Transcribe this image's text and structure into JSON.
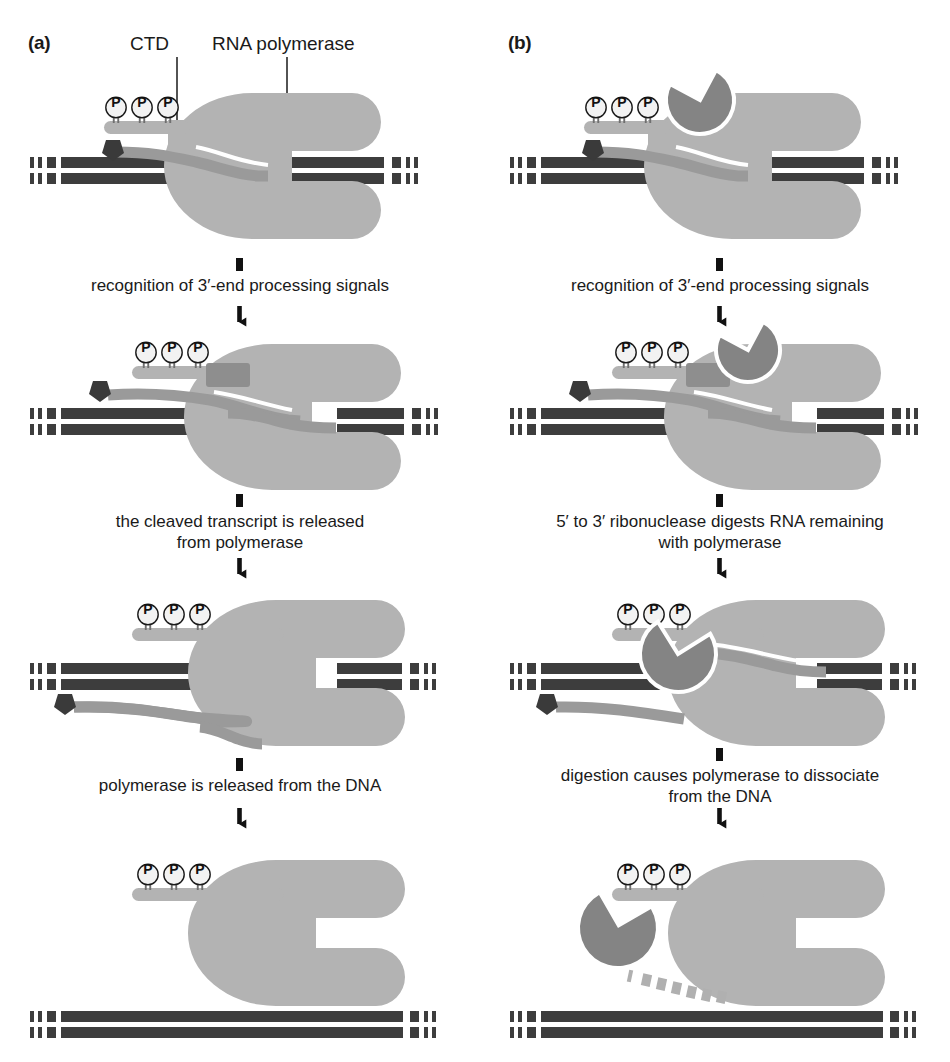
{
  "figure": {
    "title_a": "(a)",
    "title_b": "(b)",
    "callouts": {
      "ctd": "CTD",
      "rna_polymerase": "RNA polymerase"
    },
    "colors": {
      "polymerase": "#b3b3b3",
      "ribonuclease": "#848484",
      "rna": "#9a9a9a",
      "dna": "#3d3d3d",
      "cap": "#3a3a3a",
      "cleavage_factor": "#8e8e8e",
      "phosphate_fill": "#f2f2f2",
      "outline": "#1a1a1a",
      "background": "#ffffff"
    },
    "phosphate_label": "P",
    "phosphate_count": 3
  },
  "columns": [
    {
      "id": "a",
      "label": "(a)",
      "steps": [
        "recognition of 3′-end processing signals",
        "the cleaved transcript is released\nfrom polymerase",
        "polymerase is released from the DNA"
      ],
      "stages": [
        "elongating polymerase with phosphorylated CTD and nascent capped RNA",
        "cleavage factor bound at CTD, transcript cleaved",
        "cleaved transcript released, polymerase still on DNA",
        "polymerase released from the DNA"
      ]
    },
    {
      "id": "b",
      "label": "(b)",
      "steps": [
        "recognition of 3′-end processing signals",
        "5′ to 3′ ribonuclease digests RNA remaining\nwith polymerase",
        "digestion causes polymerase to dissociate\nfrom the DNA"
      ],
      "stages": [
        "elongating polymerase with ribonuclease riding on CTD",
        "cleavage factor bound at CTD, transcript cleaved, ribonuclease present",
        "5′ to 3′ ribonuclease digesting RNA remaining with polymerase",
        "polymerase dissociated from DNA, ribonuclease and digested RNA fragments free"
      ]
    }
  ]
}
